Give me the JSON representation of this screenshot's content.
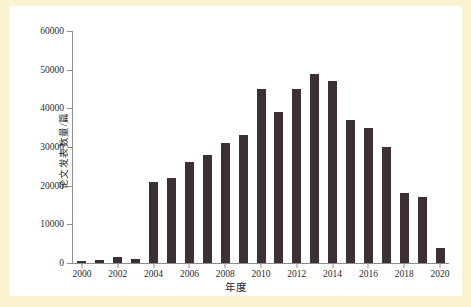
{
  "chart_data": {
    "type": "bar",
    "title": "",
    "xlabel": "年度",
    "ylabel": "论文发表数量/篇",
    "categories": [
      "2000",
      "2001",
      "2002",
      "2003",
      "2004",
      "2005",
      "2006",
      "2007",
      "2008",
      "2009",
      "2010",
      "2011",
      "2012",
      "2013",
      "2014",
      "2015",
      "2016",
      "2017",
      "2018",
      "2019",
      "2020"
    ],
    "values": [
      500,
      700,
      1500,
      1000,
      21000,
      22000,
      26000,
      28000,
      31000,
      33000,
      45000,
      39000,
      45000,
      49000,
      47000,
      37000,
      35000,
      30000,
      18000,
      17000,
      4000
    ],
    "ylim": [
      0,
      60000
    ],
    "yticks": [
      0,
      10000,
      20000,
      30000,
      40000,
      50000,
      60000
    ],
    "ytick_labels": [
      "0",
      "10000",
      "20000",
      "30000",
      "40000",
      "50000",
      "60000"
    ],
    "xtick_labels": [
      "2000",
      "2002",
      "2004",
      "2006",
      "2008",
      "2010",
      "2012",
      "2014",
      "2016",
      "2018",
      "2020"
    ],
    "grid": false,
    "legend": null,
    "bar_color": "#3c3032",
    "axis_color": "#8d8d8d",
    "plot_background": "#ffffff",
    "page_background": "#fbf2d0"
  }
}
